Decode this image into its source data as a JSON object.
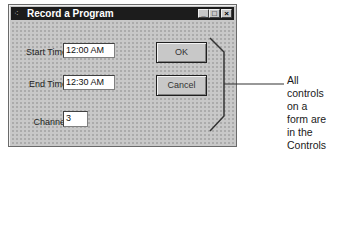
{
  "window": {
    "title": "Record a Program",
    "title_icon": "app-icon",
    "controls": {
      "minimize": "_",
      "maximize": "□",
      "close": "×"
    }
  },
  "form": {
    "start_time": {
      "label": "Start Time",
      "value": "12:00 AM"
    },
    "end_time": {
      "label": "End Time",
      "value": "12:30 AM"
    },
    "channel": {
      "label": "Channel",
      "value": "3"
    },
    "ok_label": "OK",
    "cancel_label": "Cancel"
  },
  "annotation": {
    "lines": [
      "All controls on a",
      "form are in the",
      "Controls collection"
    ]
  }
}
